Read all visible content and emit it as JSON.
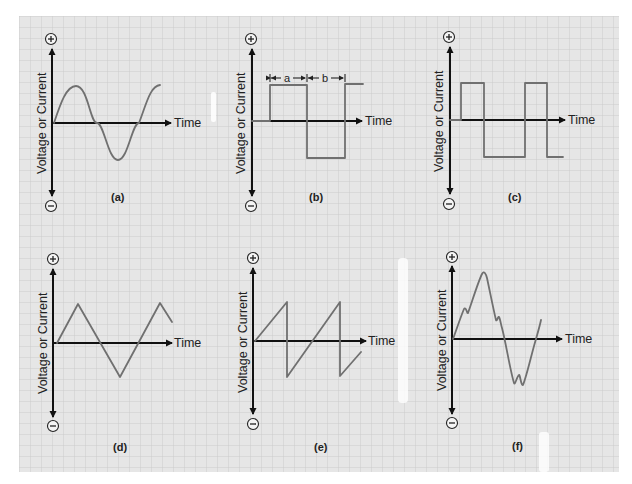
{
  "figure": {
    "colors": {
      "paper": "#e6e6e6",
      "grid": "#c9c9c9",
      "axis": "#111111",
      "wave": "#707070"
    },
    "grid_pitch_px": 11,
    "axis_y_label": "Voltage or Current",
    "axis_x_label": "Time",
    "plus_sign": "+",
    "minus_sign": "−",
    "panels": [
      {
        "id": "a",
        "label": "(a)",
        "waveform": "sine"
      },
      {
        "id": "b",
        "label": "(b)",
        "waveform": "square (unequal duty, a and b intervals)",
        "dimension_labels": [
          "a",
          "b"
        ]
      },
      {
        "id": "c",
        "label": "(c)",
        "waveform": "rectangular (pulse)"
      },
      {
        "id": "d",
        "label": "(d)",
        "waveform": "triangle"
      },
      {
        "id": "e",
        "label": "(e)",
        "waveform": "sawtooth"
      },
      {
        "id": "f",
        "label": "(f)",
        "waveform": "complex / distorted"
      }
    ]
  }
}
